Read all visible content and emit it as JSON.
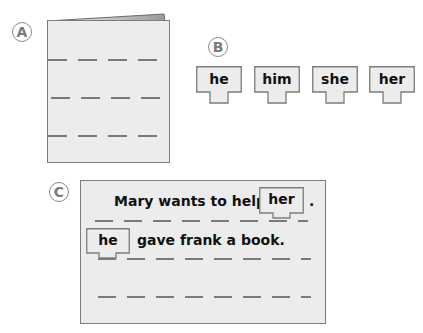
{
  "labels": {
    "a": "A",
    "b": "B",
    "c": "C"
  },
  "word_tags": [
    {
      "word": "he"
    },
    {
      "word": "him"
    },
    {
      "word": "she"
    },
    {
      "word": "her"
    }
  ],
  "sentence_box": {
    "line1": {
      "before": "Mary wants to help",
      "tag": "her",
      "after": "."
    },
    "line2": {
      "tag": "he",
      "after": "gave frank a book."
    }
  },
  "colors": {
    "sheet_fill": "#ececec",
    "sheet_border": "#7c7c7c",
    "dash": "#7a7a7a",
    "text": "#111111"
  }
}
